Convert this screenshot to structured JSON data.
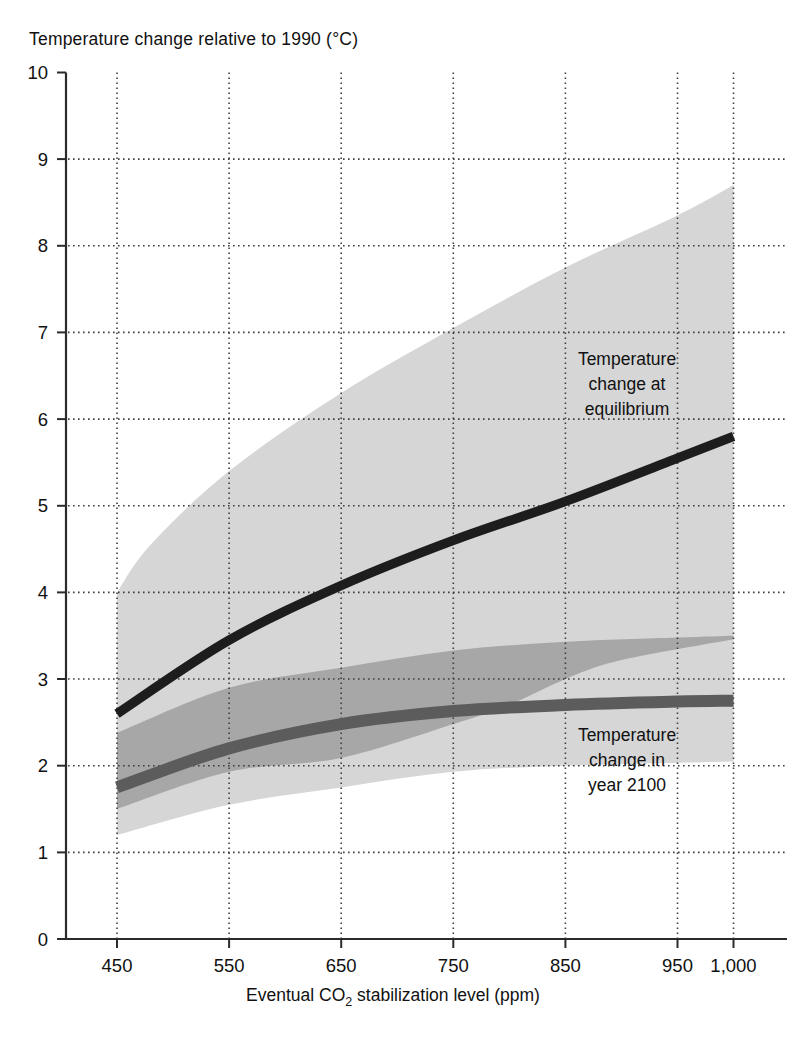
{
  "title": "Temperature change relative to 1990 (°C)",
  "xlabel_parts": {
    "pre": "Eventual CO",
    "sub": "2",
    "post": " stabilization level (ppm)"
  },
  "annotations": {
    "equilibrium": {
      "line1": "Temperature",
      "line2": "change at",
      "line3": "equilibrium"
    },
    "year2100": {
      "line1": "Temperature",
      "line2": "change in",
      "line3": "year 2100"
    }
  },
  "colors": {
    "background": "#ffffff",
    "axis": "#2b2b2b",
    "grid_dots": "#3f3f3f",
    "text": "#111111",
    "band_equilibrium_range": "#d6d6d6",
    "band_year2100_range": "#a7a7a7",
    "line_equilibrium": "#1d1d1d",
    "line_year2100": "#5c5c5c"
  },
  "chart_data": {
    "type": "line",
    "title": "Temperature change relative to 1990 (°C)",
    "xlabel": "Eventual CO2 stabilization level (ppm)",
    "ylabel": "Temperature change relative to 1990 (°C)",
    "xlim": [
      450,
      1000
    ],
    "ylim": [
      0,
      10
    ],
    "grid": true,
    "x_ticks": [
      {
        "value": 450,
        "label": "450"
      },
      {
        "value": 550,
        "label": "550"
      },
      {
        "value": 650,
        "label": "650"
      },
      {
        "value": 750,
        "label": "750"
      },
      {
        "value": 850,
        "label": "850"
      },
      {
        "value": 950,
        "label": "950"
      },
      {
        "value": 1000,
        "label": "1,000"
      }
    ],
    "y_ticks": [
      {
        "value": 0,
        "label": "0"
      },
      {
        "value": 1,
        "label": "1"
      },
      {
        "value": 2,
        "label": "2"
      },
      {
        "value": 3,
        "label": "3"
      },
      {
        "value": 4,
        "label": "4"
      },
      {
        "value": 5,
        "label": "5"
      },
      {
        "value": 6,
        "label": "6"
      },
      {
        "value": 7,
        "label": "7"
      },
      {
        "value": 8,
        "label": "8"
      },
      {
        "value": 9,
        "label": "9"
      },
      {
        "value": 10,
        "label": "10"
      }
    ],
    "series": [
      {
        "name": "Temperature change at equilibrium",
        "color_key": "line_equilibrium",
        "stroke_width": 9.5,
        "points": [
          [
            450,
            2.6
          ],
          [
            550,
            3.45
          ],
          [
            650,
            4.08
          ],
          [
            750,
            4.6
          ],
          [
            850,
            5.05
          ],
          [
            950,
            5.55
          ],
          [
            1000,
            5.8
          ]
        ]
      },
      {
        "name": "Temperature change in year 2100",
        "color_key": "line_year2100",
        "stroke_width": 12,
        "points": [
          [
            450,
            1.75
          ],
          [
            550,
            2.2
          ],
          [
            650,
            2.48
          ],
          [
            750,
            2.63
          ],
          [
            850,
            2.7
          ],
          [
            950,
            2.74
          ],
          [
            1000,
            2.75
          ]
        ]
      }
    ],
    "bands": [
      {
        "name": "Equilibrium temperature change uncertainty range",
        "color_key": "band_equilibrium_range",
        "top": [
          [
            450,
            4.0
          ],
          [
            480,
            4.55
          ],
          [
            550,
            5.4
          ],
          [
            650,
            6.3
          ],
          [
            750,
            7.05
          ],
          [
            850,
            7.75
          ],
          [
            950,
            8.35
          ],
          [
            1000,
            8.7
          ]
        ],
        "bottom": [
          [
            450,
            1.2
          ],
          [
            550,
            1.55
          ],
          [
            650,
            1.75
          ],
          [
            750,
            1.93
          ],
          [
            850,
            2.0
          ],
          [
            1000,
            2.05
          ]
        ]
      },
      {
        "name": "Year 2100 temperature change uncertainty range",
        "color_key": "band_year2100_range",
        "top": [
          [
            450,
            2.38
          ],
          [
            550,
            2.9
          ],
          [
            650,
            3.13
          ],
          [
            750,
            3.33
          ],
          [
            850,
            3.43
          ],
          [
            950,
            3.48
          ],
          [
            1000,
            3.5
          ]
        ],
        "bottom": [
          [
            450,
            1.5
          ],
          [
            550,
            1.93
          ],
          [
            650,
            2.09
          ],
          [
            750,
            2.48
          ],
          [
            800,
            2.7
          ],
          [
            850,
            3.0
          ],
          [
            900,
            3.22
          ],
          [
            1000,
            3.46
          ]
        ]
      }
    ]
  }
}
